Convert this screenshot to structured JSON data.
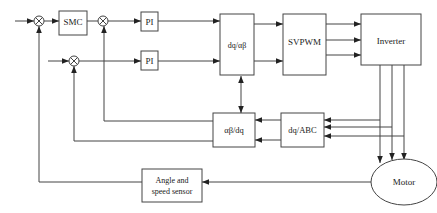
{
  "blocks": {
    "smc": "SMC",
    "pi_q": "PI",
    "pi_d": "PI",
    "dq_ab": "dq/αβ",
    "svpwm": "SVPWM",
    "inverter": "Inverter",
    "ab_dq": "αβ/dq",
    "dq_abc": "dq/ABC",
    "sensor_line1": "Angle and",
    "sensor_line2": "speed sensor",
    "motor": "Motor"
  },
  "summing_junctions": [
    "speed-error",
    "iq-error",
    "id-error"
  ],
  "icons": {
    "summing_junction": "circle-x",
    "arrow": "arrowhead"
  }
}
